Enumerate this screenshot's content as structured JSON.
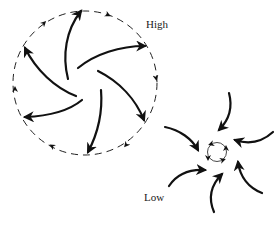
{
  "labels": {
    "high": "High",
    "low": "Low"
  },
  "caption": "",
  "colors": {
    "stroke": "#111111",
    "background": "#ffffff"
  },
  "high_system": {
    "name": "anticyclone",
    "center": [
      85,
      83
    ],
    "radius": 72,
    "boundary": "dashed circle with clockwise arrowheads",
    "flow": "outward, curving clockwise",
    "arrow_count": 6
  },
  "low_system": {
    "name": "cyclone",
    "center": [
      217,
      152
    ],
    "radius": 9,
    "boundary": "solid small circle with counterclockwise arrowheads",
    "flow": "inward, curving counterclockwise",
    "arrow_count": 6
  }
}
